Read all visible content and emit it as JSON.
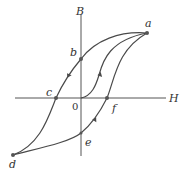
{
  "diagram": {
    "axes": {
      "vertical_label": "B",
      "horizontal_label": "H",
      "origin_label": "0"
    },
    "points": {
      "a": "a",
      "b": "b",
      "c": "c",
      "d": "d",
      "e": "e",
      "f": "f"
    },
    "colors": {
      "curve": "#4a4a4a",
      "axis": "#555555",
      "point": "#555555",
      "background": "#ffffff"
    }
  }
}
